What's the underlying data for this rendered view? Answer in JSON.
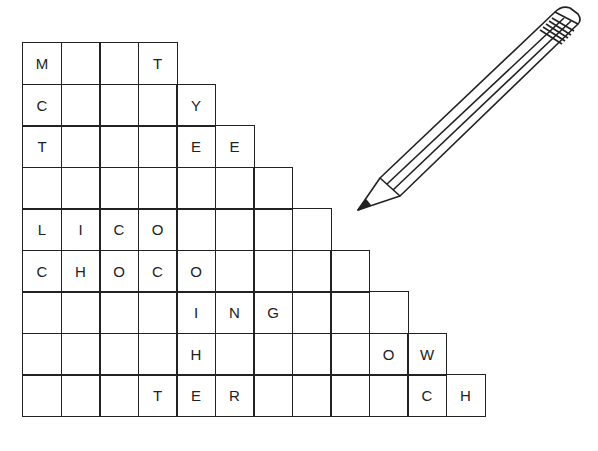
{
  "puzzle": {
    "type": "staircase word grid",
    "rows": [
      [
        "M",
        "",
        "",
        "T"
      ],
      [
        "C",
        "",
        "",
        "",
        "Y"
      ],
      [
        "T",
        "",
        "",
        "",
        "E",
        "E"
      ],
      [
        "",
        "",
        "",
        "",
        "",
        "",
        ""
      ],
      [
        "L",
        "I",
        "C",
        "O",
        "",
        "",
        "",
        ""
      ],
      [
        "C",
        "H",
        "O",
        "C",
        "O",
        "",
        "",
        "",
        ""
      ],
      [
        "",
        "",
        "",
        "",
        "I",
        "N",
        "G",
        "",
        "",
        ""
      ],
      [
        "",
        "",
        "",
        "",
        "H",
        "",
        "",
        "",
        "",
        "O",
        "W"
      ],
      [
        "",
        "",
        "",
        "T",
        "E",
        "R",
        "",
        "",
        "",
        "",
        "C",
        "H"
      ]
    ]
  },
  "illustration": {
    "icon": "pencil-icon"
  }
}
